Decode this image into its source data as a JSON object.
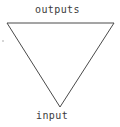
{
  "diagram": {
    "kind": "inverted-triangle-io-diagram",
    "background_color": "#ffffff",
    "stroke_color": "#4a4a4a",
    "stroke_width": 1,
    "text_color": "#3b3b3b",
    "labels": {
      "top": "outputs",
      "bottom": "input"
    },
    "vertices": {
      "top_left": {
        "x": 7,
        "y": 23
      },
      "top_right": {
        "x": 114,
        "y": 23
      },
      "bottom_apex": {
        "x": 60,
        "y": 107
      }
    },
    "polygon_points": "7,23 114,23 60,107",
    "artifacts": [
      {
        "name": "scan-speck",
        "x": 2,
        "y": 40
      }
    ]
  }
}
